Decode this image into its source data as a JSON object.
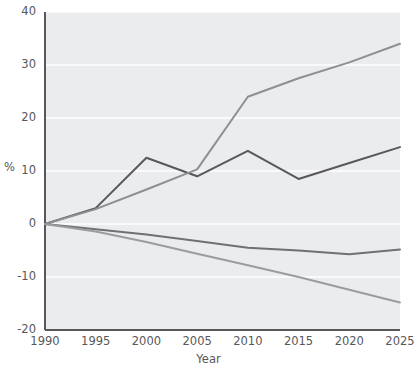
{
  "chart_data": {
    "type": "line",
    "title": "",
    "xlabel": "Year",
    "ylabel": "%",
    "x": [
      1990,
      1995,
      2000,
      2005,
      2010,
      2015,
      2020,
      2025
    ],
    "xlim": [
      1990,
      2025
    ],
    "ylim": [
      -20,
      40
    ],
    "xticks": [
      "1990",
      "1995",
      "2000",
      "2005",
      "2010",
      "2015",
      "2020",
      "2025"
    ],
    "yticks": [
      "40",
      "30",
      "20",
      "10",
      "0",
      "-10",
      "-20"
    ],
    "grid": "horizontal-white-gridlines",
    "legend": "none",
    "background": "#ebeced",
    "series": [
      {
        "name": "series-dark-volatile",
        "color": "#58585a",
        "values": [
          0,
          3.0,
          12.5,
          9.0,
          13.8,
          8.5,
          11.5,
          14.5
        ]
      },
      {
        "name": "series-gray-rising",
        "color": "#8d8f91",
        "values": [
          0,
          2.8,
          6.5,
          10.3,
          24.0,
          27.5,
          30.5,
          34.0
        ]
      },
      {
        "name": "series-dark-declining",
        "color": "#6e7072",
        "values": [
          0,
          -1.0,
          -2.0,
          -3.2,
          -4.5,
          -5.0,
          -5.7,
          -4.8
        ]
      },
      {
        "name": "series-gray-declining",
        "color": "#9a9c9e",
        "values": [
          0,
          -1.4,
          -3.4,
          -5.6,
          -7.8,
          -10.0,
          -12.4,
          -14.8
        ]
      }
    ]
  },
  "axis": {
    "y_label": "%",
    "x_label": "Year"
  }
}
